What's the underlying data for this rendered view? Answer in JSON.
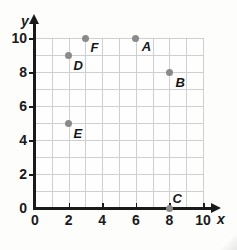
{
  "chart_data": {
    "type": "scatter",
    "title": "",
    "xlabel": "x",
    "ylabel": "y",
    "xlim": [
      0,
      10
    ],
    "ylim": [
      0,
      10
    ],
    "grid": true,
    "grid_step": 1,
    "legend": "none",
    "x_ticks": [
      "0",
      "2",
      "4",
      "6",
      "8",
      "10"
    ],
    "x_tick_values": [
      0,
      2,
      4,
      6,
      8,
      10
    ],
    "y_ticks": [
      "0",
      "2",
      "4",
      "6",
      "8",
      "10"
    ],
    "y_tick_values": [
      0,
      2,
      4,
      6,
      8,
      10
    ],
    "point_color": "#8a8a8a",
    "grid_color": "#cfcfcf",
    "axis_color": "#1a1a1a",
    "points": [
      {
        "label": "A",
        "x": 6,
        "y": 10,
        "label_dx": 6,
        "label_dy": 2
      },
      {
        "label": "B",
        "x": 8,
        "y": 8,
        "label_dx": 6,
        "label_dy": 4
      },
      {
        "label": "C",
        "x": 8,
        "y": 0,
        "label_dx": 3,
        "label_dy": -16
      },
      {
        "label": "D",
        "x": 2,
        "y": 9,
        "label_dx": 5,
        "label_dy": 4
      },
      {
        "label": "E",
        "x": 2,
        "y": 5,
        "label_dx": 5,
        "label_dy": 4
      },
      {
        "label": "F",
        "x": 3,
        "y": 10,
        "label_dx": 5,
        "label_dy": 3
      }
    ]
  }
}
